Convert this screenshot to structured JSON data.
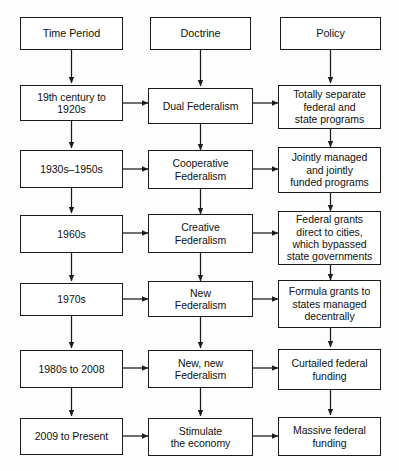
{
  "diagram": {
    "type": "flowchart",
    "columns": [
      {
        "id": "time-period",
        "header": "Time Period"
      },
      {
        "id": "doctrine",
        "header": "Doctrine"
      },
      {
        "id": "policy",
        "header": "Policy"
      }
    ],
    "rows": [
      {
        "time_period": "19th century to\n1920s",
        "doctrine": "Dual Federalism",
        "policy": "Totally separate\nfederal and\nstate programs"
      },
      {
        "time_period": "1930s–1950s",
        "doctrine": "Cooperative\nFederalism",
        "policy": "Jointly managed\nand jointly\nfunded programs"
      },
      {
        "time_period": "1960s",
        "doctrine": "Creative\nFederalism",
        "policy": "Federal grants\ndirect to cities,\nwhich bypassed\nstate governments"
      },
      {
        "time_period": "1970s",
        "doctrine": "New\nFederalism",
        "policy": "Formula grants to\nstates managed\ndecentrally"
      },
      {
        "time_period": "1980s to 2008",
        "doctrine": "New, new\nFederalism",
        "policy": "Curtailed federal\nfunding"
      },
      {
        "time_period": "2009 to Present",
        "doctrine": "Stimulate\nthe economy",
        "policy": "Massive federal\nfunding"
      }
    ],
    "colors": {
      "box_border": "#1a1a1a",
      "box_fill": "#ffffff",
      "arrow": "#1b1b1b",
      "text": "#111111",
      "background": "#fdfdfd"
    }
  }
}
